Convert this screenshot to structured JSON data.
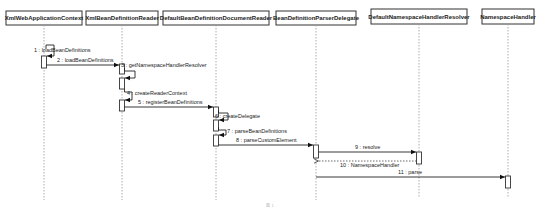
{
  "diagram": {
    "type": "UML sequence diagram",
    "lifelines": [
      {
        "id": "xwac",
        "label": "XmlWebApplicationContext",
        "x": 44
      },
      {
        "id": "xbdr",
        "label": "XmlBeanDefinitionReader",
        "x": 122
      },
      {
        "id": "dbddr",
        "label": "DefaultBeanDefinitionDocumentReader",
        "x": 216
      },
      {
        "id": "bdpd",
        "label": "BeanDefinitionParserDelegate",
        "x": 316
      },
      {
        "id": "dnhr",
        "label": "DefaultNamespaceHandlerResolver",
        "x": 419
      },
      {
        "id": "nh",
        "label": "NamespaceHandler",
        "x": 508
      }
    ],
    "messages": [
      {
        "n": "1",
        "label": "1 : loadBeanDefinitions",
        "from": "xwac",
        "to": "xwac",
        "kind": "self"
      },
      {
        "n": "2",
        "label": "2 : loadBeanDefinitions",
        "from": "xwac",
        "to": "xbdr",
        "kind": "call"
      },
      {
        "n": "3",
        "label": "3 : getNamespaceHandlerResolver",
        "from": "xbdr",
        "to": "xbdr",
        "kind": "self"
      },
      {
        "n": "4",
        "label": "4 : createReaderContext",
        "from": "xbdr",
        "to": "xbdr",
        "kind": "self"
      },
      {
        "n": "5",
        "label": "5 : registerBeanDefinitions",
        "from": "xbdr",
        "to": "dbddr",
        "kind": "call"
      },
      {
        "n": "6",
        "label": "6 : createDelegate",
        "from": "dbddr",
        "to": "dbddr",
        "kind": "self"
      },
      {
        "n": "7",
        "label": "7 : parseBeanDefinitions",
        "from": "dbddr",
        "to": "dbddr",
        "kind": "self"
      },
      {
        "n": "8",
        "label": "8 : parseCustomElement",
        "from": "dbddr",
        "to": "bdpd",
        "kind": "call"
      },
      {
        "n": "9",
        "label": "9 : resolve",
        "from": "bdpd",
        "to": "dnhr",
        "kind": "call"
      },
      {
        "n": "10",
        "label": "10 : NamespaceHandler",
        "from": "dnhr",
        "to": "bdpd",
        "kind": "return"
      },
      {
        "n": "11",
        "label": "11 : parse",
        "from": "bdpd",
        "to": "nh",
        "kind": "call"
      }
    ],
    "caption": "图 1"
  }
}
